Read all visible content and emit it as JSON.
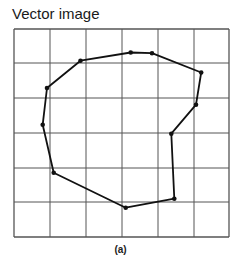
{
  "title": "Vector image",
  "caption": "(a)",
  "colors": {
    "grid": "#555555",
    "path": "#111111",
    "background": "#ffffff"
  },
  "grid": {
    "columns": 6,
    "rows": 6,
    "x": [
      14,
      50,
      86,
      122,
      158,
      194,
      229
    ],
    "y": [
      29,
      63,
      98,
      133,
      168,
      202,
      237
    ]
  },
  "polygon": {
    "closed": true,
    "points": [
      [
        130.7,
        52.5
      ],
      [
        152,
        53.2
      ],
      [
        201.2,
        72.5
      ],
      [
        196,
        104.7
      ],
      [
        171.3,
        133.7
      ],
      [
        174.3,
        198.7
      ],
      [
        125.7,
        207.7
      ],
      [
        53.7,
        172.7
      ],
      [
        42.7,
        124.7
      ],
      [
        47,
        88
      ],
      [
        80.5,
        60.7
      ]
    ]
  }
}
